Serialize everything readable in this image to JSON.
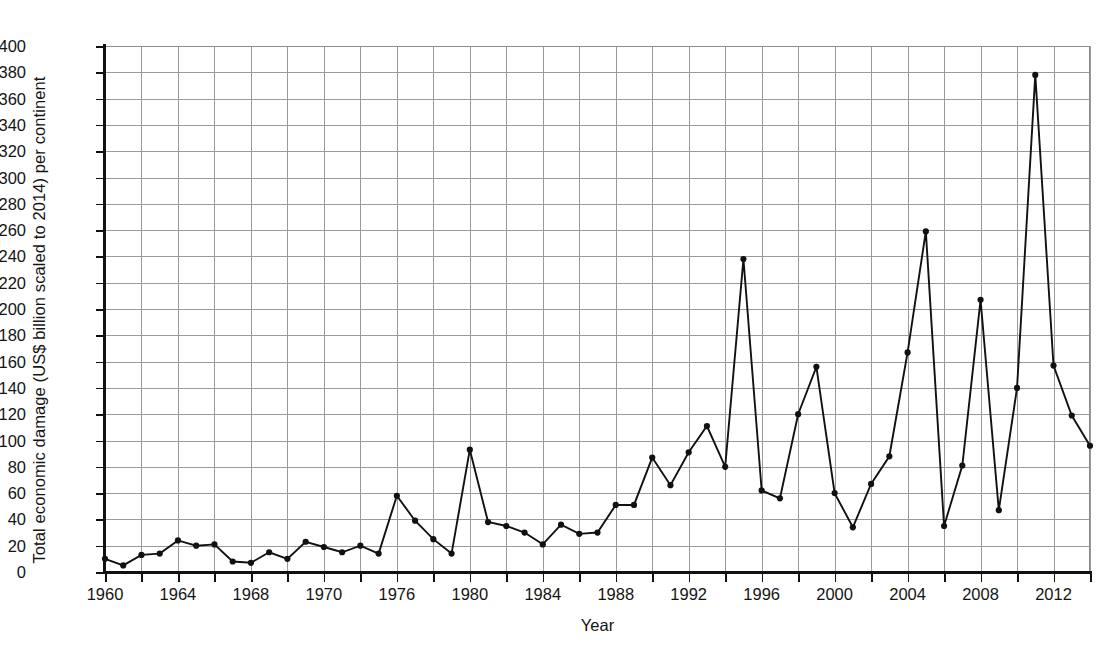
{
  "chart_data": {
    "type": "line",
    "title": "",
    "xlabel": "Year",
    "ylabel": "Total economic damage (US$ billion scaled to 2014) per continent",
    "xlim": [
      1960,
      2014
    ],
    "ylim": [
      0,
      400
    ],
    "ytick_step": 20,
    "xtick_major_step": 4,
    "xtick_minor_step": 2,
    "grid": true,
    "legend": null,
    "marker": "filled-circle",
    "line_color": "#111111",
    "grid_color": "#9a9a9a",
    "axis_color": "#111111",
    "ytick_labels": [
      "0",
      "20",
      "40",
      "60",
      "80",
      "100",
      "120",
      "140",
      "160",
      "180",
      "200",
      "220",
      "240",
      "260",
      "280",
      "300",
      "320",
      "340",
      "360",
      "380",
      "400"
    ],
    "ytick_values": [
      0,
      20,
      40,
      60,
      80,
      100,
      120,
      140,
      160,
      180,
      200,
      220,
      240,
      260,
      280,
      300,
      320,
      340,
      360,
      380,
      400
    ],
    "xtick_labels": [
      "1960",
      "1964",
      "1968",
      "1970",
      "1976",
      "1980",
      "1984",
      "1988",
      "1992",
      "1996",
      "2000",
      "2004",
      "2008",
      "2012"
    ],
    "xtick_label_values": [
      1960,
      1964,
      1968,
      1972,
      1976,
      1980,
      1984,
      1988,
      1992,
      1996,
      2000,
      2004,
      2008,
      2012
    ],
    "xtick_minor_values": [
      1962,
      1966,
      1970,
      1974,
      1978,
      1982,
      1986,
      1990,
      1994,
      1998,
      2002,
      2006,
      2010,
      2014
    ],
    "x": [
      1960,
      1961,
      1962,
      1963,
      1964,
      1965,
      1966,
      1967,
      1968,
      1969,
      1970,
      1971,
      1972,
      1973,
      1974,
      1975,
      1976,
      1977,
      1978,
      1979,
      1980,
      1981,
      1982,
      1983,
      1984,
      1985,
      1986,
      1987,
      1988,
      1989,
      1990,
      1991,
      1992,
      1993,
      1994,
      1995,
      1996,
      1997,
      1998,
      1999,
      2000,
      2001,
      2002,
      2003,
      2004,
      2005,
      2006,
      2007,
      2008,
      2009,
      2010,
      2011,
      2012,
      2013,
      2014
    ],
    "values": [
      10,
      5,
      13,
      14,
      24,
      20,
      21,
      8,
      7,
      15,
      10,
      23,
      19,
      15,
      20,
      14,
      58,
      39,
      25,
      14,
      93,
      38,
      35,
      30,
      21,
      36,
      29,
      30,
      51,
      51,
      87,
      66,
      91,
      111,
      80,
      238,
      62,
      56,
      120,
      156,
      60,
      34,
      67,
      88,
      167,
      259,
      35,
      81,
      207,
      47,
      140,
      378,
      157,
      119,
      96
    ],
    "series": [
      {
        "name": "Total economic damage",
        "values": [
          10,
          5,
          13,
          14,
          24,
          20,
          21,
          8,
          7,
          15,
          10,
          23,
          19,
          15,
          20,
          14,
          58,
          39,
          25,
          14,
          93,
          38,
          35,
          30,
          21,
          36,
          29,
          30,
          51,
          51,
          87,
          66,
          91,
          111,
          80,
          238,
          62,
          56,
          120,
          156,
          60,
          34,
          67,
          88,
          167,
          259,
          35,
          81,
          207,
          47,
          140,
          378,
          157,
          119,
          96
        ]
      }
    ],
    "notable_peaks": [
      {
        "year": 1976,
        "value": 58
      },
      {
        "year": 1980,
        "value": 93
      },
      {
        "year": 1993,
        "value": 111
      },
      {
        "year": 1995,
        "value": 238
      },
      {
        "year": 1999,
        "value": 156
      },
      {
        "year": 2005,
        "value": 259
      },
      {
        "year": 2008,
        "value": 207
      },
      {
        "year": 2011,
        "value": 378
      }
    ]
  }
}
